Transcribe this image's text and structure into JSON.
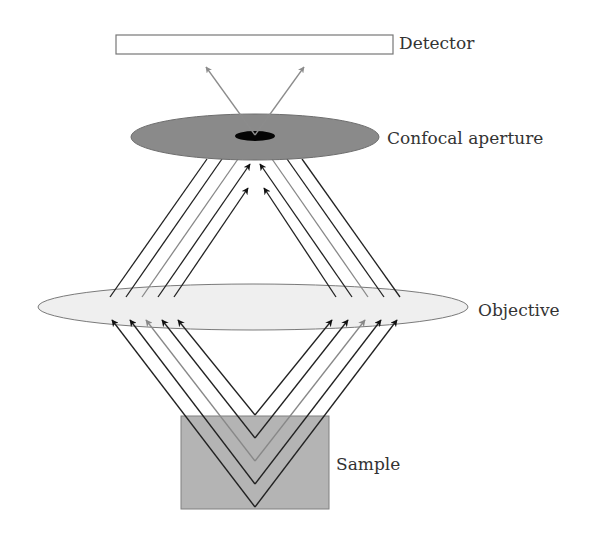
{
  "figure": {
    "type": "confocal-microscope-schematic",
    "labels": {
      "detector": "Detector",
      "confocal_aperture": "Confocal aperture",
      "objective": "Objective",
      "sample": "Sample"
    },
    "components": [
      {
        "name": "Detector",
        "shape": "rectangle",
        "fill": "#ffffff",
        "stroke": "#777777"
      },
      {
        "name": "Confocal aperture",
        "shape": "ellipse",
        "fill": "#8a8a8a",
        "pinhole_fill": "#000000"
      },
      {
        "name": "Objective",
        "shape": "ellipse",
        "fill": "#efefef",
        "stroke": "#777777"
      },
      {
        "name": "Sample",
        "shape": "rectangle",
        "fill": "#b4b4b4",
        "stroke": "#777777"
      }
    ],
    "rays": {
      "count_per_side": 5,
      "colors": [
        "#222222",
        "#222222",
        "#888888",
        "#222222",
        "#222222"
      ],
      "detector_ray_color": "#8c8c8c"
    }
  }
}
